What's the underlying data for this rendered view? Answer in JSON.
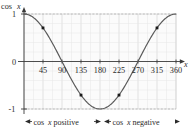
{
  "chart_data": {
    "type": "line",
    "title": "",
    "subtitle": "",
    "xlabel": "x",
    "ylabel": "cos x",
    "xlim": [
      0,
      360
    ],
    "ylim": [
      -1,
      1
    ],
    "grid": true,
    "legend": "none",
    "xticks": [
      45,
      90,
      135,
      180,
      225,
      270,
      315,
      360
    ],
    "xtick_labels": [
      "45",
      "90",
      "135",
      "180",
      "225",
      "270",
      "315",
      "360"
    ],
    "yticks": [
      1,
      0,
      -1
    ],
    "ytick_labels": [
      "1",
      "0",
      "-1"
    ],
    "series": [
      {
        "name": "cos x",
        "x": [
          0,
          15,
          30,
          45,
          60,
          75,
          90,
          105,
          120,
          135,
          150,
          165,
          180,
          195,
          210,
          225,
          240,
          255,
          270,
          285,
          300,
          315,
          330,
          345,
          360
        ],
        "values": [
          1,
          0.966,
          0.866,
          0.707,
          0.5,
          0.259,
          0,
          -0.259,
          -0.5,
          -0.707,
          -0.866,
          -0.966,
          -1,
          -0.966,
          -0.866,
          -0.707,
          -0.5,
          -0.259,
          0,
          0.259,
          0.5,
          0.707,
          0.866,
          0.966,
          1
        ]
      }
    ],
    "marked_points": [
      {
        "x": 45,
        "y": 0.707
      },
      {
        "x": 135,
        "y": -0.707
      },
      {
        "x": 225,
        "y": -0.707
      },
      {
        "x": 315,
        "y": 0.707
      }
    ],
    "annotations": [
      {
        "id": "positive-range",
        "text": "cos x positive",
        "text_prefix": "cos ",
        "text_var": "x",
        "text_suffix": " positive",
        "from": 0,
        "to": 180
      },
      {
        "id": "negative-range",
        "text": "cos x negative",
        "text_prefix": "cos ",
        "text_var": "x",
        "text_suffix": " negative",
        "from": 180,
        "to": 360
      }
    ]
  },
  "axes": {
    "y_axis_label_prefix": "cos",
    "y_axis_label_var": "x",
    "x_axis_label_var": "x"
  },
  "ytick_labels": {
    "top": "1",
    "middle": "0",
    "bottom": "-1"
  },
  "xtick_labels": {
    "t45": "45",
    "t90": "90",
    "t135": "135",
    "t180": "180",
    "t225": "225",
    "t270": "270",
    "t315": "315",
    "t360": "360"
  },
  "annotation_labels": {
    "positive_prefix": "cos",
    "positive_var": "x",
    "positive_suffix": "positive",
    "negative_prefix": "cos",
    "negative_var": "x",
    "negative_suffix": "negative"
  },
  "colors": {
    "curve": "#555555",
    "grid_minor": "#e2e2e2",
    "grid_major": "#cfcfcf",
    "axis": "#3a3a3a",
    "text": "#2b2b2b",
    "point": "#1a1a1a",
    "plot_bg": "#fbfbfb"
  }
}
